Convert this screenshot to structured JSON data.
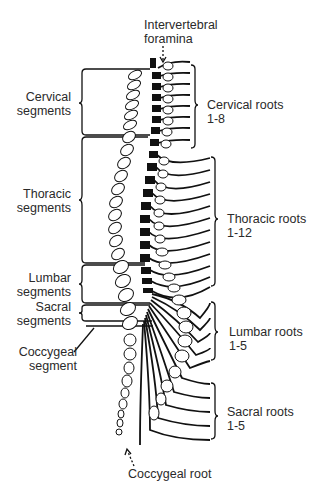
{
  "diagram": {
    "type": "anatomical",
    "top_label": [
      "Intervertebral",
      "foramina"
    ],
    "left_labels": [
      {
        "id": "cervical",
        "lines": [
          "Cervical",
          "segments"
        ]
      },
      {
        "id": "thoracic",
        "lines": [
          "Thoracic",
          "segments"
        ]
      },
      {
        "id": "lumbar",
        "lines": [
          "Lumbar",
          "segments"
        ]
      },
      {
        "id": "sacral",
        "lines": [
          "Sacral",
          "segments"
        ]
      },
      {
        "id": "coccygeal",
        "lines": [
          "Coccygeal",
          "segment"
        ]
      }
    ],
    "right_labels": [
      {
        "id": "cervical-roots",
        "lines": [
          "Cervical roots",
          "1-8"
        ]
      },
      {
        "id": "thoracic-roots",
        "lines": [
          "Thoracic roots",
          "1-12"
        ]
      },
      {
        "id": "lumbar-roots",
        "lines": [
          "Lumbar roots",
          "1-5"
        ]
      },
      {
        "id": "sacral-roots",
        "lines": [
          "Sacral roots",
          "1-5"
        ]
      }
    ],
    "bottom_label": "Coccygeal root",
    "vertebra_numbers": {
      "cervical": [
        "1",
        "2",
        "3",
        "4",
        "5",
        "6",
        "7",
        "8"
      ],
      "thoracic": [
        "1",
        "2",
        "3",
        "4",
        "5",
        "6",
        "7",
        "8",
        "9",
        "10",
        "11",
        "12"
      ],
      "lumbar": [
        "1",
        "2",
        "3",
        "4",
        "5"
      ],
      "sacral": [
        "1",
        "2",
        "3",
        "4",
        "5"
      ]
    },
    "colors": {
      "ink": "#111111",
      "text": "#2a2a2a",
      "background": "#ffffff"
    }
  }
}
